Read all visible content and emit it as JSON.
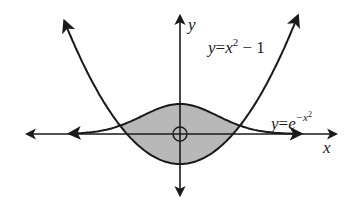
{
  "figure": {
    "type": "function-region-diagram",
    "axes": {
      "x_label": "x",
      "y_label": "y"
    },
    "curves": [
      {
        "name": "parabola",
        "label_lhs": "y",
        "label_eq": "=",
        "label_base": "x",
        "label_exp": "2",
        "label_rest": " − 1",
        "expression": "y=x^2-1"
      },
      {
        "name": "gaussian",
        "label_lhs": "y",
        "label_eq": "=",
        "label_base": "e",
        "label_exp": "−x",
        "label_exp2": "2",
        "expression": "y=e^{-x^2}"
      }
    ],
    "shaded_region": "region between y=e^{-x^2} (above) and y=x^2-1 (below)",
    "origin_marker": "circle-at-origin",
    "colors": {
      "curve": "#1a1a1a",
      "shade": "#b8b8b8",
      "background": "#ffffff"
    }
  }
}
